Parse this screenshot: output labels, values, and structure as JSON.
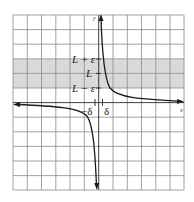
{
  "diagram": {
    "type": "epsilon-delta limit graph",
    "axes": {
      "x_label": "x",
      "y_label": "y"
    },
    "band_labels": {
      "upper": "L + ε",
      "middle": "L",
      "lower": "L − ε"
    },
    "delta_labels": {
      "left": "−δ",
      "right": "δ"
    },
    "colors": {
      "grid": "#8a8a8a",
      "band": "#d6d6d6",
      "curve": "#1a1a1a",
      "axis": "#1a1a1a"
    },
    "grid": {
      "columns": 12,
      "rows": 12
    }
  }
}
